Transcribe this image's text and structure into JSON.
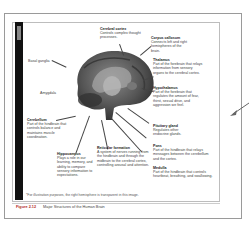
{
  "figure": {
    "side_tab_label": "",
    "labels": {
      "cerebral_cortex": {
        "title": "Cerebral cortex",
        "text": "Controls complex thought processes."
      },
      "corpus_callosum": {
        "title": "Corpus callosum",
        "text": "Connects left and right hemispheres of the brain."
      },
      "thalamus": {
        "title": "Thalamus",
        "text": "Part of the forebrain that relays information from sensory organs to the cerebral cortex."
      },
      "hypothalamus": {
        "title": "Hypothalamus",
        "text": "Part of the forebrain that regulates the amount of fear, thirst, sexual drive, and aggression we feel."
      },
      "pituitary_gland": {
        "title": "Pituitary gland",
        "text": "Regulates other endocrine glands."
      },
      "pons": {
        "title": "Pons",
        "text": "Part of the hindbrain that relays messages between the cerebellum and the cortex."
      },
      "medulla": {
        "title": "Medulla",
        "text": "Part of the hindbrain that controls heartbeat, breathing, and swallowing."
      },
      "reticular_formation": {
        "title": "Reticular formation",
        "text": "A system of nerves running from the hindbrain and through the midbrain to the cerebral cortex, controlling arousal and attention."
      },
      "hippocampus": {
        "title": "Hippocampus",
        "text": "Plays a role in our learning, memory, and ability to compare sensory information to expectations."
      },
      "cerebellum": {
        "title": "Cerebellum",
        "text": "Part of the hindbrain that controls balance and maintains muscle coordination."
      },
      "basal_ganglia": {
        "title": "",
        "text": "Basal ganglia"
      },
      "amygdala": {
        "title": "",
        "text": "Amygdala"
      }
    },
    "footnote": "*For illustration purposes, the right hemisphere is transparent in this image.",
    "caption_number": "Figure 2.12",
    "caption_text": "Major Structures of the Human Brain"
  },
  "colors": {
    "caption_accent": "#b0281c",
    "side_bar": "#111111"
  }
}
